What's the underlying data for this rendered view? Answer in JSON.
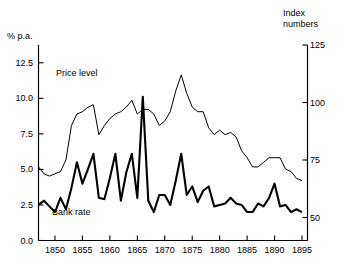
{
  "chart_data": {
    "type": "line",
    "title": "",
    "xlabel": "",
    "ylabel": "% p.a.",
    "ylabel_right": "Index numbers",
    "xlim": [
      1847,
      1896
    ],
    "ylim": [
      0.0,
      13.75
    ],
    "ylim_right": [
      40,
      125
    ],
    "grid": false,
    "legend": "inline-annotations",
    "x_ticks": [
      1850,
      1855,
      1860,
      1865,
      1870,
      1875,
      1880,
      1885,
      1890,
      1895
    ],
    "x_tick_labels": [
      "1850",
      "1855",
      "1860",
      "1865",
      "1870",
      "1875",
      "1880",
      "1885",
      "1890",
      "1895"
    ],
    "y_ticks_left": [
      0.0,
      2.5,
      5.0,
      7.5,
      10.0,
      12.5
    ],
    "y_tick_labels_left": [
      "0.0",
      "2.5",
      "5.0",
      "7.5",
      "10.0",
      "12.5"
    ],
    "y_ticks_right": [
      50,
      75,
      100,
      125
    ],
    "y_tick_labels_right": [
      "50",
      "75",
      "100",
      "125"
    ],
    "x": [
      1847,
      1848,
      1849,
      1850,
      1851,
      1852,
      1853,
      1854,
      1855,
      1856,
      1857,
      1858,
      1859,
      1860,
      1861,
      1862,
      1863,
      1864,
      1865,
      1866,
      1867,
      1868,
      1869,
      1870,
      1871,
      1872,
      1873,
      1874,
      1875,
      1876,
      1877,
      1878,
      1879,
      1880,
      1881,
      1882,
      1883,
      1884,
      1885,
      1886,
      1887,
      1888,
      1889,
      1890,
      1891,
      1892,
      1893,
      1894,
      1895
    ],
    "series": [
      {
        "name": "Bank rate",
        "axis": "left",
        "units": "% p.a.",
        "color": "#000000",
        "line_width": 2.1,
        "values": [
          2.5,
          2.8,
          2.4,
          2.0,
          3.0,
          2.2,
          3.7,
          5.5,
          4.0,
          5.0,
          6.1,
          3.0,
          2.9,
          4.4,
          6.1,
          2.8,
          4.8,
          6.1,
          3.0,
          10.1,
          2.8,
          2.0,
          3.2,
          3.2,
          2.5,
          4.2,
          6.1,
          3.2,
          3.8,
          2.7,
          3.5,
          3.8,
          2.4,
          2.5,
          2.6,
          3.0,
          2.6,
          2.5,
          2.0,
          2.0,
          2.6,
          2.4,
          3.0,
          4.0,
          2.4,
          2.5,
          2.0,
          2.2,
          2.0
        ]
      },
      {
        "name": "Price level",
        "axis": "right",
        "units": "index numbers",
        "color": "#000000",
        "line_width": 1.0,
        "values": [
          72,
          69,
          68,
          69,
          70,
          75,
          90,
          95,
          96,
          98,
          99,
          86,
          90,
          93,
          95,
          96,
          98,
          101,
          95,
          97,
          97,
          95,
          90,
          92,
          96,
          105,
          112,
          104,
          98,
          96,
          96,
          89,
          86,
          88,
          86,
          87,
          85,
          79,
          76,
          72,
          72,
          74,
          76,
          76,
          76,
          71,
          70,
          67,
          66
        ]
      }
    ],
    "annotations": [
      {
        "text": "Price level",
        "x": 1853.5,
        "y_right": 108
      },
      {
        "text": "Bank rate",
        "x": 1852.8,
        "y_left": 2.1
      }
    ]
  },
  "axes": {
    "left_title": "% p.a.",
    "right_title": "Index\nnumbers"
  }
}
